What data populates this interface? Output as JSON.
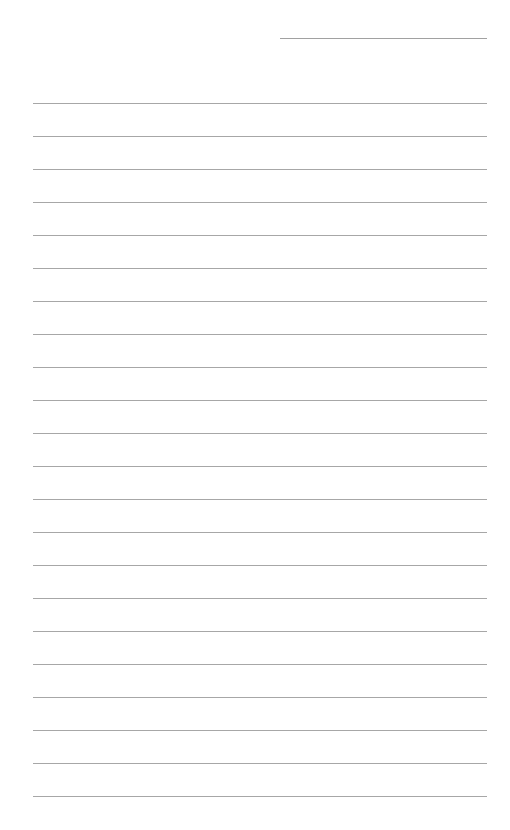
{
  "page": {
    "type": "blank-lined-paper",
    "background": "#ffffff",
    "line_color": "#8a8a8a",
    "header_line": {
      "left": 280,
      "right": 487,
      "y": 38
    },
    "ruled_lines": {
      "left": 33,
      "right": 487,
      "start_y": 103,
      "spacing": 33,
      "count": 22
    }
  }
}
